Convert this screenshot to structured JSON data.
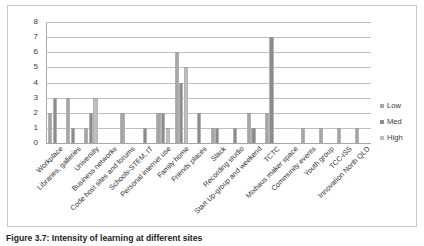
{
  "figure": {
    "caption": "Figure 3.7: Intensity of learning at different sites"
  },
  "legend": {
    "position": "right",
    "items": [
      {
        "label": "Low",
        "color": "#a6a6a6"
      },
      {
        "label": "Med",
        "color": "#8c8c8c"
      },
      {
        "label": "High",
        "color": "#bfbfbf"
      }
    ]
  },
  "axes": {
    "y_ticks": [
      "8",
      "7",
      "6",
      "5",
      "4",
      "3",
      "2",
      "1",
      "0"
    ],
    "ylim": [
      0,
      8
    ],
    "grid": true
  },
  "chart_data": {
    "type": "bar",
    "title": "",
    "xlabel": "",
    "ylabel": "",
    "ylim": [
      0,
      8
    ],
    "grid": true,
    "legend_position": "right",
    "categories": [
      "Workplace",
      "Libraries, galleries",
      "University",
      "Business networks",
      "Code host sites and forums",
      "Schools-STEM, IT",
      "Personal internet use",
      "Family home",
      "Friends places",
      "Slack",
      "Recording studio",
      "Start Up-group and weekend",
      "TCTC",
      "Mixhaus maker space",
      "Community events",
      "Youth group",
      "TCC-iSS",
      "Innovation North QLD"
    ],
    "series": [
      {
        "name": "Low",
        "color": "#a6a6a6",
        "values": [
          2,
          3,
          1,
          0,
          2,
          0,
          2,
          6,
          0,
          1,
          0,
          2,
          2,
          0,
          1,
          1,
          1,
          1
        ]
      },
      {
        "name": "Med",
        "color": "#8c8c8c",
        "values": [
          3,
          1,
          2,
          0,
          0,
          1,
          2,
          4,
          2,
          1,
          1,
          1,
          7,
          0,
          0,
          0,
          0,
          0
        ]
      },
      {
        "name": "High",
        "color": "#bfbfbf",
        "values": [
          0,
          0,
          3,
          0,
          0,
          0,
          1,
          5,
          0,
          0,
          0,
          0,
          0,
          0,
          0,
          0,
          0,
          0
        ]
      }
    ]
  }
}
